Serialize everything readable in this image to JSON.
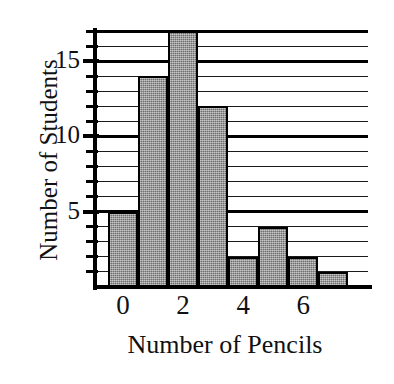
{
  "chart_data": {
    "type": "bar",
    "title": "",
    "xlabel": "Number of Pencils",
    "ylabel": "Number of Students",
    "categories": [
      "0",
      "1",
      "2",
      "3",
      "4",
      "5",
      "6",
      "7"
    ],
    "values": [
      5,
      14,
      17,
      12,
      2,
      4,
      2,
      1
    ],
    "x_tick_labels": [
      "0",
      "2",
      "4",
      "6"
    ],
    "x_tick_values": [
      0,
      2,
      4,
      6
    ],
    "y_tick_labels": [
      "5",
      "10",
      "15"
    ],
    "y_tick_values": [
      5,
      10,
      15
    ],
    "y_minor_ticks": [
      1,
      2,
      3,
      4,
      6,
      7,
      8,
      9,
      11,
      12,
      13,
      14,
      16,
      17
    ],
    "ylim": [
      0,
      17
    ],
    "xlim": [
      -0.5,
      7.5
    ],
    "grid": true,
    "grid_orientation": "horizontal",
    "legend": "none",
    "bar_fill_color": "#8a8a8a",
    "bar_edge_color": "#000000",
    "axis_color": "#000000",
    "background_color": "#ffffff"
  }
}
